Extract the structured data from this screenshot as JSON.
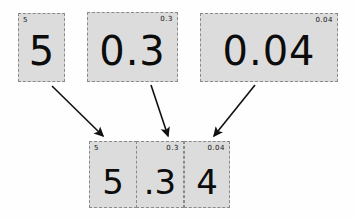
{
  "diagram": {
    "background_color": "#fefefe",
    "card_fill_color": "#dcdcdc",
    "card_border_color": "#8a8a8a",
    "text_color": "#0c0c0c"
  },
  "source_cards": [
    {
      "tag": "5",
      "value": "5",
      "tag_align": "left"
    },
    {
      "tag": "0.3",
      "value": "0.3",
      "tag_align": "right"
    },
    {
      "tag": "0.04",
      "value": "0.04",
      "tag_align": "right"
    }
  ],
  "result_cards": [
    {
      "tag": "5",
      "value": "5",
      "tag_align": "left"
    },
    {
      "tag": "0.3",
      "value": ".3",
      "tag_align": "right"
    },
    {
      "tag": "0.04",
      "value": "4",
      "tag_align": "right"
    }
  ],
  "arrows": [
    {
      "name": "arrow-ones-to-result",
      "from": [
        52,
        86
      ],
      "to": [
        105,
        138
      ]
    },
    {
      "name": "arrow-tenths-to-result",
      "from": [
        151,
        85
      ],
      "to": [
        169,
        138
      ]
    },
    {
      "name": "arrow-hundredths-to-result",
      "from": [
        255,
        85
      ],
      "to": [
        212,
        138
      ]
    }
  ]
}
